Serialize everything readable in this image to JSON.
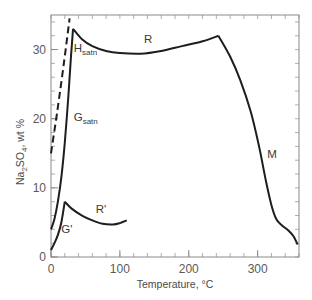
{
  "chart_data": {
    "type": "line",
    "title": "",
    "xlabel": "Temperature, °C",
    "ylabel": "Na2SO4, wt %",
    "ylabel_parts": {
      "pre": "Na",
      "sub1": "2",
      "mid": "SO",
      "sub2": "4",
      "post": ", wt %"
    },
    "xlim": [
      0,
      360
    ],
    "ylim": [
      0,
      35
    ],
    "xticks": [
      0,
      100,
      200,
      300
    ],
    "yticks": [
      0,
      10,
      20,
      30
    ],
    "xtick_labels": [
      "0",
      "100",
      "200",
      "300"
    ],
    "ytick_labels": [
      "0",
      "10",
      "20",
      "30"
    ],
    "minor_xtick_step": 20,
    "minor_ytick_step": 2,
    "grid": false,
    "legend": null,
    "series": [
      {
        "name": "metastable (dashed)",
        "style": "dashed",
        "points": [
          [
            0,
            15
          ],
          [
            9,
            21
          ],
          [
            18,
            27.5
          ],
          [
            27,
            34.5
          ]
        ]
      },
      {
        "name": "G_satn",
        "style": "solid",
        "points": [
          [
            0,
            4
          ],
          [
            5,
            5.5
          ],
          [
            10,
            8
          ],
          [
            15,
            11.5
          ],
          [
            20,
            16.5
          ],
          [
            25,
            23
          ],
          [
            29,
            29
          ],
          [
            32,
            33
          ]
        ]
      },
      {
        "name": "H_satn / R",
        "style": "solid",
        "points": [
          [
            32,
            33
          ],
          [
            45,
            31.5
          ],
          [
            60,
            30.5
          ],
          [
            80,
            29.8
          ],
          [
            100,
            29.5
          ],
          [
            130,
            29.4
          ],
          [
            160,
            29.8
          ],
          [
            190,
            30.5
          ],
          [
            220,
            31.2
          ],
          [
            243,
            32
          ]
        ]
      },
      {
        "name": "M",
        "style": "solid",
        "points": [
          [
            243,
            32
          ],
          [
            260,
            29
          ],
          [
            275,
            25.5
          ],
          [
            290,
            21
          ],
          [
            302,
            16
          ],
          [
            312,
            11
          ],
          [
            320,
            7.5
          ],
          [
            327,
            5.5
          ],
          [
            335,
            4.6
          ],
          [
            345,
            3.8
          ],
          [
            352,
            3
          ],
          [
            358,
            1.8
          ]
        ]
      },
      {
        "name": "G'",
        "style": "solid",
        "points": [
          [
            0,
            1
          ],
          [
            5,
            2
          ],
          [
            10,
            3.2
          ],
          [
            15,
            5
          ],
          [
            20,
            8
          ]
        ]
      },
      {
        "name": "R'",
        "style": "solid",
        "points": [
          [
            20,
            8
          ],
          [
            30,
            7
          ],
          [
            45,
            6
          ],
          [
            60,
            5.3
          ],
          [
            75,
            4.8
          ],
          [
            90,
            4.7
          ],
          [
            100,
            4.9
          ],
          [
            110,
            5.3
          ]
        ]
      }
    ],
    "annotations": [
      {
        "text": "H",
        "sub": "satn",
        "x": 33,
        "y": 29.6
      },
      {
        "text": "G",
        "sub": "satn",
        "x": 33,
        "y": 19.6
      },
      {
        "text": "R",
        "x": 135,
        "y": 30.9
      },
      {
        "text": "R'",
        "x": 65,
        "y": 6.4
      },
      {
        "text": "G'",
        "x": 15,
        "y": 3.4
      },
      {
        "text": "M",
        "x": 314,
        "y": 14.3
      }
    ]
  },
  "colors": {
    "frame": "#8a8a8a",
    "curve": "#1e1e1e",
    "text": "#505050"
  }
}
